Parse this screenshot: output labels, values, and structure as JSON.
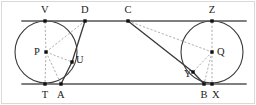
{
  "figure": {
    "type": "geometry-diagram",
    "canvas": {
      "width": 256,
      "height": 105
    },
    "colors": {
      "stroke_solid": "#3a3a3a",
      "stroke_tangent": "#555555",
      "stroke_dashed": "#9a9a9a",
      "point_fill": "#111111",
      "label_color": "#1a1a1a",
      "frame": "#d9d9d9",
      "background": "#ffffff"
    },
    "frame": {
      "x": 1.5,
      "y": 1.5,
      "width": 253,
      "height": 102
    },
    "circles": [
      {
        "name": "circle-P",
        "center_label": "P",
        "cx": 46,
        "cy": 52,
        "r": 31
      },
      {
        "name": "circle-Q",
        "center_label": "Q",
        "cx": 212,
        "cy": 52,
        "r": 31
      }
    ],
    "tangent_lines": [
      {
        "name": "upper-common-tangent",
        "x1": 22,
        "y1": 21,
        "x2": 246,
        "y2": 21
      },
      {
        "name": "lower-common-tangent",
        "x1": 22,
        "y1": 84,
        "x2": 246,
        "y2": 84
      }
    ],
    "solid_segments": [
      {
        "name": "segment-D-U-A",
        "points": "85,21 72,62 61,84"
      },
      {
        "name": "segment-C-Y-B",
        "points": "128,21 193,72 204,84"
      }
    ],
    "dashed_segments": [
      {
        "name": "radius-P-V",
        "x1": 46,
        "y1": 52,
        "x2": 45,
        "y2": 21
      },
      {
        "name": "radius-P-T",
        "x1": 46,
        "y1": 52,
        "x2": 45,
        "y2": 84
      },
      {
        "name": "radius-P-U",
        "x1": 46,
        "y1": 52,
        "x2": 72,
        "y2": 62
      },
      {
        "name": "segment-P-D",
        "x1": 46,
        "y1": 52,
        "x2": 85,
        "y2": 21
      },
      {
        "name": "segment-P-A",
        "x1": 46,
        "y1": 52,
        "x2": 61,
        "y2": 84
      },
      {
        "name": "radius-Q-Z",
        "x1": 212,
        "y1": 52,
        "x2": 212,
        "y2": 21
      },
      {
        "name": "radius-Q-X",
        "x1": 212,
        "y1": 52,
        "x2": 212,
        "y2": 84
      },
      {
        "name": "radius-Q-Y",
        "x1": 212,
        "y1": 52,
        "x2": 193,
        "y2": 72
      },
      {
        "name": "segment-Q-B",
        "x1": 212,
        "y1": 52,
        "x2": 204,
        "y2": 84
      },
      {
        "name": "segment-C-Q",
        "x1": 128,
        "y1": 21,
        "x2": 212,
        "y2": 52
      },
      {
        "name": "segment-C-Y-dashed",
        "x1": 128,
        "y1": 21,
        "x2": 193,
        "y2": 72
      }
    ],
    "points": [
      {
        "name": "point-V",
        "label": "V",
        "x": 45,
        "y": 21,
        "lx": 45,
        "ly": 10
      },
      {
        "name": "point-D",
        "label": "D",
        "x": 85,
        "y": 21,
        "lx": 85,
        "ly": 10
      },
      {
        "name": "point-C",
        "label": "C",
        "x": 128,
        "y": 21,
        "lx": 128,
        "ly": 10
      },
      {
        "name": "point-Z",
        "label": "Z",
        "x": 212,
        "y": 21,
        "lx": 212,
        "ly": 10
      },
      {
        "name": "point-P",
        "label": "P",
        "x": 46,
        "y": 52,
        "lx": 37,
        "ly": 52
      },
      {
        "name": "point-Q",
        "label": "Q",
        "x": 212,
        "y": 52,
        "lx": 221,
        "ly": 52
      },
      {
        "name": "point-U",
        "label": "U",
        "x": 72,
        "y": 62,
        "lx": 80,
        "ly": 60
      },
      {
        "name": "point-Y",
        "label": "Y",
        "x": 193,
        "y": 72,
        "lx": 188,
        "ly": 74
      },
      {
        "name": "point-T",
        "label": "T",
        "x": 45,
        "y": 84,
        "lx": 45,
        "ly": 95
      },
      {
        "name": "point-A",
        "label": "A",
        "x": 61,
        "y": 84,
        "lx": 61,
        "ly": 95
      },
      {
        "name": "point-B",
        "label": "B",
        "x": 204,
        "y": 84,
        "lx": 204,
        "ly": 95
      },
      {
        "name": "point-X",
        "label": "X",
        "x": 212,
        "y": 84,
        "lx": 216,
        "ly": 95
      }
    ]
  }
}
